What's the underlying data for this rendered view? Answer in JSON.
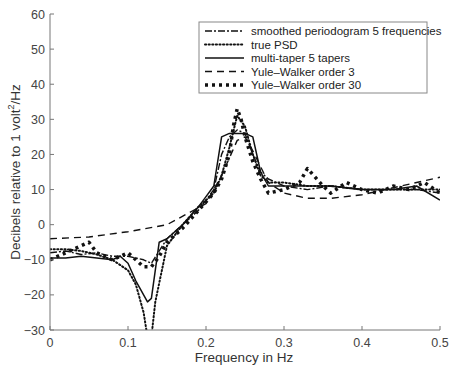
{
  "chart_data": {
    "type": "line",
    "title": "",
    "xlabel": "Frequency in Hz",
    "ylabel": "Decibels relative to 1 volt²/Hz",
    "ylabel_parts": {
      "main": "Decibels relative to 1 volt",
      "sup": "2",
      "tail": "/Hz"
    },
    "xlim": [
      0,
      0.5
    ],
    "ylim": [
      -30,
      60
    ],
    "xticks": [
      0,
      0.1,
      0.2,
      0.3,
      0.4,
      0.5
    ],
    "xtick_labels": [
      "0",
      "0.1",
      "0.2",
      "0.3",
      "0.4",
      "0.5"
    ],
    "yticks": [
      -30,
      -20,
      -10,
      0,
      10,
      20,
      30,
      40,
      50,
      60
    ],
    "ytick_labels": [
      "−30",
      "−20",
      "−10",
      "0",
      "10",
      "20",
      "30",
      "40",
      "50",
      "60"
    ],
    "grid": false,
    "legend_position": "upper right",
    "series": [
      {
        "name": "smoothed periodogram 5 frequencies",
        "style": "dashdot",
        "x": [
          0,
          0.02,
          0.04,
          0.06,
          0.08,
          0.1,
          0.12,
          0.13,
          0.15,
          0.17,
          0.19,
          0.21,
          0.22,
          0.23,
          0.24,
          0.25,
          0.26,
          0.27,
          0.28,
          0.3,
          0.33,
          0.36,
          0.4,
          0.44,
          0.47,
          0.5
        ],
        "y": [
          -8,
          -7.5,
          -8.5,
          -8,
          -9,
          -9,
          -10,
          -11,
          -4,
          0,
          4,
          10,
          20,
          25,
          27,
          26,
          20,
          15,
          13,
          11,
          10,
          11,
          10,
          10,
          10,
          9
        ]
      },
      {
        "name": "true PSD",
        "style": "dotted",
        "x": [
          0,
          0.02,
          0.04,
          0.06,
          0.08,
          0.1,
          0.11,
          0.12,
          0.125,
          0.13,
          0.135,
          0.15,
          0.17,
          0.19,
          0.21,
          0.22,
          0.23,
          0.24,
          0.25,
          0.26,
          0.27,
          0.28,
          0.3,
          0.33,
          0.36,
          0.4,
          0.44,
          0.47,
          0.5
        ],
        "y": [
          -7,
          -7,
          -7.5,
          -8.5,
          -10,
          -13,
          -17,
          -25,
          -32,
          -32,
          -22,
          -6,
          0,
          5,
          9,
          14,
          22,
          31,
          28,
          20,
          14,
          12,
          12,
          11,
          11,
          10,
          10,
          10,
          10
        ]
      },
      {
        "name": "multi-taper 5 tapers",
        "style": "solid",
        "x": [
          0,
          0.02,
          0.04,
          0.06,
          0.08,
          0.09,
          0.1,
          0.11,
          0.12,
          0.125,
          0.13,
          0.14,
          0.15,
          0.17,
          0.19,
          0.2,
          0.21,
          0.22,
          0.23,
          0.24,
          0.25,
          0.26,
          0.27,
          0.28,
          0.3,
          0.33,
          0.36,
          0.4,
          0.44,
          0.47,
          0.5
        ],
        "y": [
          -9.5,
          -9.5,
          -9,
          -9.5,
          -10,
          -9,
          -11,
          -16,
          -20,
          -22,
          -21,
          -5,
          -4,
          0,
          5,
          8,
          11,
          25,
          26,
          26,
          26,
          25,
          15,
          11,
          11,
          11,
          11,
          10,
          10,
          11,
          7
        ]
      },
      {
        "name": "Yule–Walker order 3",
        "style": "dashed",
        "x": [
          0,
          0.05,
          0.1,
          0.15,
          0.2,
          0.22,
          0.24,
          0.25,
          0.26,
          0.28,
          0.3,
          0.33,
          0.36,
          0.4,
          0.45,
          0.5
        ],
        "y": [
          -4,
          -3.5,
          -2,
          0,
          6,
          14,
          24,
          25,
          21,
          12,
          9,
          7.5,
          7.5,
          8.5,
          11,
          13.5
        ]
      },
      {
        "name": "Yule–Walker order 30",
        "style": "heavy-dotted",
        "x": [
          0,
          0.02,
          0.04,
          0.05,
          0.06,
          0.08,
          0.1,
          0.12,
          0.13,
          0.14,
          0.15,
          0.17,
          0.19,
          0.21,
          0.22,
          0.23,
          0.235,
          0.24,
          0.245,
          0.25,
          0.26,
          0.27,
          0.28,
          0.3,
          0.32,
          0.33,
          0.35,
          0.36,
          0.38,
          0.4,
          0.42,
          0.44,
          0.46,
          0.48,
          0.5
        ],
        "y": [
          -10,
          -8,
          -6,
          -5,
          -8,
          -10,
          -8,
          -12,
          -12,
          -9,
          -5,
          -1,
          4,
          9,
          13,
          20,
          28,
          33,
          30,
          25,
          18,
          13,
          9,
          10,
          12,
          16,
          11,
          9,
          12,
          10,
          9,
          11,
          10,
          12,
          9
        ]
      }
    ]
  },
  "legend": {
    "items": [
      {
        "label": "smoothed periodogram 5 frequencies",
        "style": "dashdot"
      },
      {
        "label": "true PSD",
        "style": "dotted"
      },
      {
        "label": "multi-taper 5 tapers",
        "style": "solid"
      },
      {
        "label": "Yule–Walker order 3",
        "style": "dashed"
      },
      {
        "label": "Yule–Walker order 30",
        "style": "heavy-dotted"
      }
    ]
  },
  "colors": {
    "line": "#111111",
    "axis": "#777777",
    "text": "#444444"
  }
}
